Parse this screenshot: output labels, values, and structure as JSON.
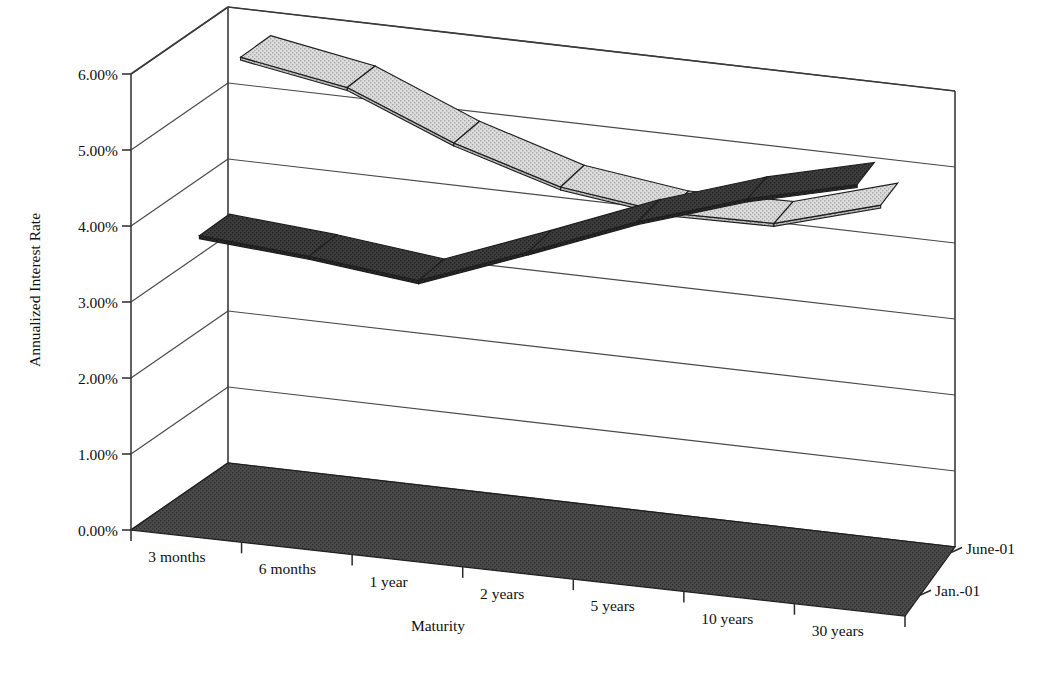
{
  "chart_data": {
    "type": "line",
    "render": "3d-ribbon",
    "title": "",
    "xlabel": "Maturity",
    "ylabel": "Annualized Interest Rate",
    "zlabel": "",
    "categories": [
      "3 months",
      "6 months",
      "1 year",
      "2 years",
      "5 years",
      "10 years",
      "30 years"
    ],
    "ytick_labels": [
      "0.00%",
      "1.00%",
      "2.00%",
      "3.00%",
      "4.00%",
      "5.00%",
      "6.00%"
    ],
    "ytick_values": [
      0,
      1,
      2,
      3,
      4,
      5,
      6
    ],
    "ylim": [
      0,
      6
    ],
    "grid": true,
    "legend_position": "right-depth-axis",
    "series": [
      {
        "name": "Jan.-01",
        "depth_index": 0,
        "color": "#3a3a3a",
        "side_color": "#262626",
        "values": [
          3.83,
          3.72,
          3.56,
          4.1,
          4.66,
          5.12,
          5.47
        ]
      },
      {
        "name": "June-01",
        "depth_index": 1,
        "color": "#d2d2d2",
        "side_color": "#b4b4b4",
        "values": [
          5.79,
          5.55,
          4.98,
          4.56,
          4.38,
          4.4,
          4.8
        ]
      }
    ]
  },
  "axes": {
    "y_title": "Annualized Interest Rate",
    "x_title": "Maturity"
  }
}
